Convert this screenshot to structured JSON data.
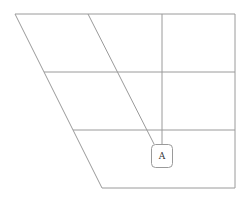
{
  "diagram": {
    "type": "skewed-grid",
    "colors": {
      "line": "#9a9a9a",
      "box_fill": "#ffffff",
      "label": "#333333",
      "background": "#ffffff"
    },
    "outline": {
      "points": [
        [
          15,
          14
        ],
        [
          235,
          14
        ],
        [
          235,
          188
        ],
        [
          102,
          188
        ]
      ]
    },
    "horizontal_dividers": [
      {
        "y": 72,
        "x1": 44,
        "x2": 235
      },
      {
        "y": 130,
        "x1": 73,
        "x2": 235
      }
    ],
    "slanted_divider": {
      "x1": 88,
      "y1": 14,
      "x2": 154,
      "y2": 144
    },
    "vertical_divider": {
      "x": 162,
      "y1": 14,
      "y2": 144
    },
    "node": {
      "label": "A",
      "x": 151,
      "y": 144,
      "width": 21,
      "height": 23,
      "corner_radius": 4
    }
  }
}
